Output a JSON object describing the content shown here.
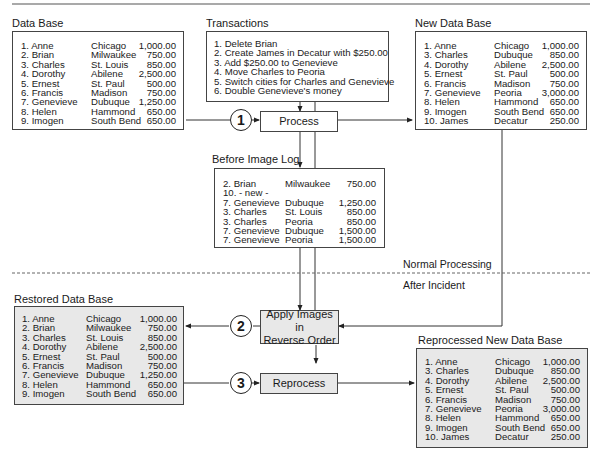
{
  "diagram": {
    "sections": {
      "normal": "Normal Processing",
      "after": "After Incident"
    },
    "data_base": {
      "title": "Data Base",
      "rows": [
        [
          "1. Anne",
          "Chicago",
          "1,000.00"
        ],
        [
          "2. Brian",
          "Milwaukee",
          "750.00"
        ],
        [
          "3. Charles",
          "St. Louis",
          "850.00"
        ],
        [
          "4. Dorothy",
          "Abilene",
          "2,500.00"
        ],
        [
          "5. Ernest",
          "St. Paul",
          "500.00"
        ],
        [
          "6. Francis",
          "Madison",
          "750.00"
        ],
        [
          "7. Genevieve",
          "Dubuque",
          "1,250.00"
        ],
        [
          "8. Helen",
          "Hammond",
          "650.00"
        ],
        [
          "9. Imogen",
          "South Bend",
          "650.00"
        ]
      ]
    },
    "transactions": {
      "title": "Transactions",
      "items": [
        "1. Delete Brian",
        "2. Create James in Decatur with $250.00",
        "3. Add $250.00 to Genevieve",
        "4. Move Charles to Peoria",
        "5. Switch cities for Charles and Genevieve",
        "6. Double Genevieve's money"
      ]
    },
    "new_data_base": {
      "title": "New Data Base",
      "rows": [
        [
          "1. Anne",
          "Chicago",
          "1,000.00"
        ],
        [
          "3. Charles",
          "Dubuque",
          "850.00"
        ],
        [
          "4. Dorothy",
          "Abilene",
          "2,500.00"
        ],
        [
          "5. Ernest",
          "St. Paul",
          "500.00"
        ],
        [
          "6. Francis",
          "Madison",
          "750.00"
        ],
        [
          "7. Genevieve",
          "Peoria",
          "3,000.00"
        ],
        [
          "8. Helen",
          "Hammond",
          "650.00"
        ],
        [
          "9. Imogen",
          "South Bend",
          "650.00"
        ],
        [
          "10. James",
          "Decatur",
          "250.00"
        ]
      ]
    },
    "before_image_log": {
      "title": "Before Image Log",
      "rows": [
        [
          "2. Brian",
          "Milwaukee",
          "750.00"
        ],
        [
          "10. - new -",
          "",
          ""
        ],
        [
          "7. Genevieve",
          "Dubuque",
          "1,250.00"
        ],
        [
          "3. Charles",
          "St. Louis",
          "850.00"
        ],
        [
          "3. Charles",
          "Peoria",
          "850.00"
        ],
        [
          "7. Genevieve",
          "Dubuque",
          "1,500.00"
        ],
        [
          "7. Genevieve",
          "Peoria",
          "1,500.00"
        ]
      ]
    },
    "restored_data_base": {
      "title": "Restored Data Base",
      "rows": [
        [
          "1. Anne",
          "Chicago",
          "1,000.00"
        ],
        [
          "2. Brian",
          "Milwaukee",
          "750.00"
        ],
        [
          "3. Charles",
          "St. Louis",
          "850.00"
        ],
        [
          "4. Dorothy",
          "Abilene",
          "2,500.00"
        ],
        [
          "5. Ernest",
          "St. Paul",
          "500.00"
        ],
        [
          "6. Francis",
          "Madison",
          "750.00"
        ],
        [
          "7. Genevieve",
          "Dubuque",
          "1,250.00"
        ],
        [
          "8. Helen",
          "Hammond",
          "650.00"
        ],
        [
          "9. Imogen",
          "South Bend",
          "650.00"
        ]
      ]
    },
    "reprocessed_new_data_base": {
      "title": "Reprocessed New Data Base",
      "rows": [
        [
          "1. Anne",
          "Chicago",
          "1,000.00"
        ],
        [
          "3. Charles",
          "Dubuque",
          "850.00"
        ],
        [
          "4. Dorothy",
          "Abilene",
          "2,500.00"
        ],
        [
          "5. Ernest",
          "St. Paul",
          "500.00"
        ],
        [
          "6. Francis",
          "Madison",
          "750.00"
        ],
        [
          "7. Genevieve",
          "Peoria",
          "3,000.00"
        ],
        [
          "8. Helen",
          "Hammond",
          "650.00"
        ],
        [
          "9. Imogen",
          "South Bend",
          "650.00"
        ],
        [
          "10. James",
          "Decatur",
          "250.00"
        ]
      ]
    },
    "steps": {
      "process": {
        "number": "1",
        "label": "Process"
      },
      "apply": {
        "number": "2",
        "label_line1": "Apply Images in",
        "label_line2": "Reverse Order"
      },
      "reprocess": {
        "number": "3",
        "label": "Reprocess"
      }
    },
    "colors": {
      "line": "#333333",
      "gray_box": "#e8e8e8",
      "text": "#1a1a1a"
    }
  }
}
